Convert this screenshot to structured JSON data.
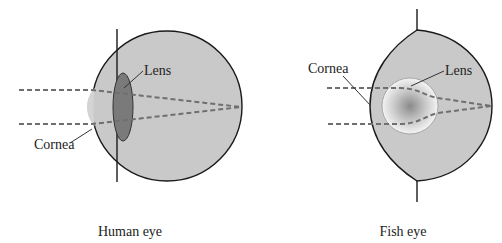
{
  "figures": [
    {
      "id": "human",
      "caption": "Human eye",
      "labels": {
        "lens": "Lens",
        "cornea": "Cornea"
      }
    },
    {
      "id": "fish",
      "caption": "Fish eye",
      "labels": {
        "lens": "Lens",
        "cornea": "Cornea"
      }
    }
  ],
  "colors": {
    "eyeball_fill": "#c9c9c9",
    "cornea_fill": "#d4d4d4",
    "human_lens_fill": "#7a7a7a",
    "fish_lens_center": "#8a8a8a",
    "fish_lens_edge": "#f2f2f2",
    "outline": "#1a1a1a",
    "ray": "#6f6f6f"
  }
}
